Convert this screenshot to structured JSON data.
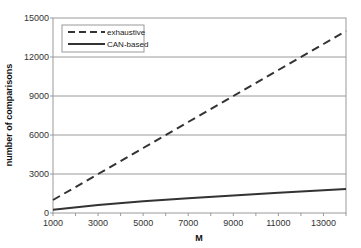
{
  "chart_data": {
    "type": "line",
    "title": "",
    "xlabel": "M",
    "ylabel": "number of comparisons",
    "xlim": [
      1000,
      14000
    ],
    "ylim": [
      0,
      15000
    ],
    "x_ticks": [
      1000,
      3000,
      5000,
      7000,
      9000,
      11000,
      13000
    ],
    "y_ticks": [
      0,
      3000,
      6000,
      9000,
      12000,
      15000
    ],
    "grid": "horizontal",
    "legend_position": "upper-left",
    "x": [
      1000,
      3000,
      5000,
      7000,
      9000,
      11000,
      13000,
      14000
    ],
    "series": [
      {
        "name": "exhaustive",
        "style": "dashed",
        "color": "#333333",
        "values": [
          1000,
          3000,
          5000,
          7000,
          9000,
          11000,
          13000,
          14000
        ]
      },
      {
        "name": "CAN-based",
        "style": "solid",
        "color": "#333333",
        "values": [
          250,
          620,
          900,
          1130,
          1350,
          1550,
          1750,
          1850
        ]
      }
    ]
  },
  "labels": {
    "xlabel": "M",
    "ylabel": "number of comparisons",
    "legend": [
      "exhaustive",
      "CAN-based"
    ],
    "x_ticks": [
      "1000",
      "3000",
      "5000",
      "7000",
      "9000",
      "11000",
      "13000"
    ],
    "y_ticks": [
      "0",
      "3000",
      "6000",
      "9000",
      "12000",
      "15000"
    ]
  }
}
